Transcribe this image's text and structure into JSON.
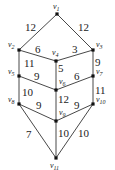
{
  "graph": {
    "nodes": [
      {
        "id": "v1",
        "label": "v1",
        "x": 57,
        "y": 14,
        "lx": 53,
        "ly": 9
      },
      {
        "id": "v2",
        "label": "v2",
        "x": 19,
        "y": 50,
        "lx": 8,
        "ly": 47
      },
      {
        "id": "v3",
        "label": "v3",
        "x": 93,
        "y": 50,
        "lx": 96,
        "ly": 47
      },
      {
        "id": "v4",
        "label": "v4",
        "x": 56,
        "y": 61,
        "lx": 52,
        "ly": 55
      },
      {
        "id": "v5",
        "label": "v5",
        "x": 19,
        "y": 76,
        "lx": 8,
        "ly": 74
      },
      {
        "id": "v6",
        "label": "v6",
        "x": 56,
        "y": 90,
        "lx": 59,
        "ly": 84
      },
      {
        "id": "v7",
        "label": "v7",
        "x": 93,
        "y": 76,
        "lx": 96,
        "ly": 74
      },
      {
        "id": "v8",
        "label": "v8",
        "x": 19,
        "y": 104,
        "lx": 8,
        "ly": 102
      },
      {
        "id": "v9",
        "label": "v9",
        "x": 56,
        "y": 121,
        "lx": 59,
        "ly": 115
      },
      {
        "id": "v10",
        "label": "v10",
        "x": 93,
        "y": 104,
        "lx": 96,
        "ly": 102
      },
      {
        "id": "v11",
        "label": "v11",
        "x": 56,
        "y": 158,
        "lx": 50,
        "ly": 168
      }
    ],
    "edges": [
      {
        "from": "v1",
        "to": "v2",
        "weight": "12",
        "wx": 25,
        "wy": 31
      },
      {
        "from": "v1",
        "to": "v3",
        "weight": "12",
        "wx": 78,
        "wy": 31
      },
      {
        "from": "v2",
        "to": "v4",
        "weight": "6",
        "wx": 35,
        "wy": 53
      },
      {
        "from": "v4",
        "to": "v3",
        "weight": "3",
        "wx": 72,
        "wy": 53
      },
      {
        "from": "v2",
        "to": "v5",
        "weight": "11",
        "wx": 24,
        "wy": 67
      },
      {
        "from": "v4",
        "to": "v6",
        "weight": "5",
        "wx": 58,
        "wy": 72
      },
      {
        "from": "v3",
        "to": "v7",
        "weight": "9",
        "wx": 95,
        "wy": 66
      },
      {
        "from": "v5",
        "to": "v6",
        "weight": "9",
        "wx": 34,
        "wy": 80
      },
      {
        "from": "v6",
        "to": "v7",
        "weight": "6",
        "wx": 74,
        "wy": 80
      },
      {
        "from": "v5",
        "to": "v8",
        "weight": "10",
        "wx": 22,
        "wy": 96
      },
      {
        "from": "v6",
        "to": "v9",
        "weight": "12",
        "wx": 58,
        "wy": 103
      },
      {
        "from": "v7",
        "to": "v10",
        "weight": "11",
        "wx": 95,
        "wy": 94
      },
      {
        "from": "v8",
        "to": "v9",
        "weight": "9",
        "wx": 36,
        "wy": 109
      },
      {
        "from": "v9",
        "to": "v10",
        "weight": "9",
        "wx": 74,
        "wy": 109
      },
      {
        "from": "v8",
        "to": "v11",
        "weight": "7",
        "wx": 26,
        "wy": 138
      },
      {
        "from": "v9",
        "to": "v11",
        "weight": "10",
        "wx": 58,
        "wy": 137
      },
      {
        "from": "v10",
        "to": "v11",
        "weight": "10",
        "wx": 78,
        "wy": 137
      }
    ]
  }
}
